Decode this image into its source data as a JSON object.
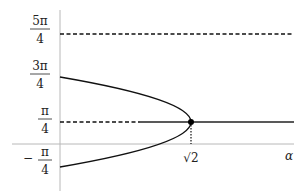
{
  "diagram": {
    "type": "bifurcation-diagram",
    "axes": {
      "x_label": "α",
      "x_ticks": [
        {
          "label": "√2",
          "value": 1.41421
        }
      ],
      "y_ticks": [
        {
          "num": "5π",
          "den": "4",
          "value": "5π/4"
        },
        {
          "num": "3π",
          "den": "4",
          "value": "3π/4"
        },
        {
          "num": "π",
          "den": "4",
          "value": "π/4"
        },
        {
          "num": "π",
          "den": "4",
          "sign": "−",
          "value": "−π/4"
        }
      ]
    },
    "curves": [
      {
        "name": "upper-and-lower-branch",
        "style": "solid",
        "shape": "sideways parabola from (0,3π/4) through (√2,π/4) to (0,−π/4)"
      },
      {
        "name": "pi-over-4-unstable",
        "style": "dashed",
        "from_alpha": 0,
        "to_alpha": 0.87,
        "y": "π/4"
      },
      {
        "name": "pi-over-4-stable",
        "style": "solid",
        "from_alpha": 0.87,
        "y": "π/4"
      },
      {
        "name": "five-pi-over-4",
        "style": "dashed",
        "y": "5π/4"
      },
      {
        "name": "sqrt2-guide",
        "style": "dotted",
        "x": "√2"
      }
    ],
    "bifurcation_point": {
      "alpha": "√2",
      "y": "π/4"
    },
    "colors": {
      "ink": "#111111",
      "axis": "#b0b0b0",
      "background": "#ffffff"
    }
  }
}
